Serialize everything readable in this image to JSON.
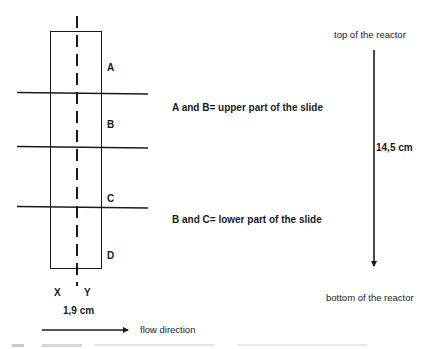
{
  "diagram": {
    "type": "reactor-slide-schematic",
    "segments": [
      {
        "label": "A"
      },
      {
        "label": "B"
      },
      {
        "label": "C"
      },
      {
        "label": "D"
      }
    ],
    "axis_labels": {
      "left": "X",
      "right": "Y"
    },
    "width_label": "1,9 cm",
    "notes": {
      "upper": "A and B= upper part of the slide",
      "lower": "B and C= lower part of the slide"
    },
    "reactor": {
      "top_label": "top of the reactor",
      "bottom_label": "bottom of the reactor",
      "height_label": "14,5 cm"
    },
    "flow": {
      "label": "flow direction"
    },
    "colors": {
      "line": "#1a1a1a",
      "background": "#ffffff"
    }
  }
}
